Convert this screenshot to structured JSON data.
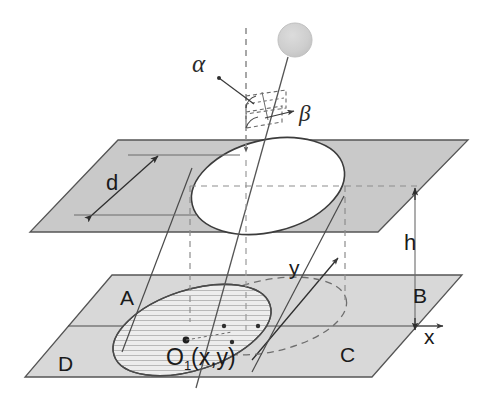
{
  "figure": {
    "background_color": "#ffffff",
    "width": 481,
    "height": 404
  },
  "colors": {
    "plane_fill": "#c9c9c9",
    "plane_fill_lower": "#d7d7d7",
    "plane_edge": "#4d4d4d",
    "line": "#3a3a3a",
    "dashed": "#6e6e6e",
    "sphere_fill": "#cfcfcf",
    "sphere_edge": "#c2c2c2",
    "hatch": "#8a8a8a",
    "text": "#1a1a1a"
  },
  "labels": {
    "alpha": "α",
    "beta": "β",
    "d": "d",
    "h": "h",
    "x_axis": "x",
    "y_axis": "y",
    "origin": "O",
    "origin_subscript": "1",
    "origin_coords": "(x,y)",
    "quadrant_a": "A",
    "quadrant_b": "B",
    "quadrant_c": "C",
    "quadrant_d": "D"
  },
  "elements": {
    "sphere": {
      "name": "source-sphere",
      "cx": 295,
      "cy": 40,
      "r": 17
    },
    "upper_plane": {
      "name": "upper-plane",
      "points": "118,140 468,140 378,232 30,232"
    },
    "lower_plane": {
      "name": "lower-plane",
      "points": "112,275 462,275 372,377 25,377"
    },
    "upper_ellipse": {
      "name": "upper-plane-aperture-ellipse",
      "cx": 268,
      "cy": 186,
      "rx": 78,
      "ry": 46,
      "rotation": -14
    },
    "hatched_ellipse": {
      "name": "beam-footprint-ellipse",
      "cx": 192,
      "cy": 330,
      "rx": 82,
      "ry": 40,
      "rotation": -18
    },
    "dashed_ellipse": {
      "name": "projected-ellipse",
      "cx": 268,
      "cy": 316,
      "rx": 80,
      "ry": 36,
      "rotation": -12
    },
    "vertical_axis": {
      "name": "vertical-reference-dashed-line",
      "x": 246,
      "y_top": 28,
      "y_bottom": 150
    },
    "beam_line": {
      "name": "beam-center-line",
      "x1": 288,
      "y1": 57,
      "x2": 196,
      "y2": 388
    },
    "height_marker": {
      "name": "height-dimension-h",
      "x": 415,
      "y_top": 186,
      "y_bottom": 330
    }
  },
  "annotations": {
    "alpha_leader": "leader line from alpha label to zenith angle arc",
    "beta_leader": "leader arrow from beta label to azimuth angle arc",
    "d_dimension": "double-headed arrow spanning the aperture ellipse width",
    "h_dimension": "vertical separation between the upper and lower planes"
  }
}
